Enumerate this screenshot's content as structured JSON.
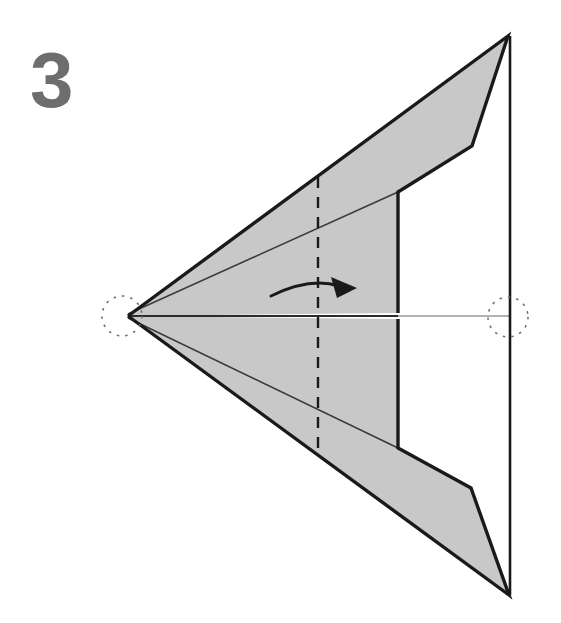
{
  "figure": {
    "kind": "origami-fold-diagram",
    "step_number": "3",
    "step_number_color": "#6e6e6e",
    "background_color": "#ffffff",
    "paper_fill_color": "#c8c8c8",
    "paper_outline_color": "#1a1a1a",
    "crease_line_color": "#1a1a1a",
    "reference_line_color": "#9a9a9a",
    "arrow_color": "#1a1a1a",
    "width": 561,
    "height": 623
  },
  "geometry": {
    "left_apex": {
      "x": 128,
      "y": 316
    },
    "top_right_apex": {
      "x": 508,
      "y": 36
    },
    "bottom_right_apex": {
      "x": 509,
      "y": 595
    },
    "right_edge_x": 510,
    "inner_flap_edge_x": 398,
    "upper_bend_vertex": {
      "x": 472,
      "y": 146
    },
    "upper_notch_corner": {
      "x": 398,
      "y": 192
    },
    "lower_bend_vertex": {
      "x": 471,
      "y": 488
    },
    "lower_notch_corner": {
      "x": 398,
      "y": 448
    },
    "center_line_y": 316,
    "upper_shape": [
      [
        128,
        316
      ],
      [
        508,
        36
      ],
      [
        472,
        146
      ],
      [
        398,
        192
      ],
      [
        398,
        313
      ]
    ],
    "lower_shape": [
      [
        128,
        316
      ],
      [
        398,
        319
      ],
      [
        398,
        448
      ],
      [
        471,
        488
      ],
      [
        509,
        595
      ]
    ]
  },
  "annotations": {
    "valley_crease": {
      "label": "vertical-dashed-crease-line",
      "style": "dashed",
      "x": 318,
      "y_top": 177,
      "y_bottom": 455
    },
    "center_reference_line": {
      "label": "horizontal-center-reference-line",
      "y": 316,
      "x_start": 128,
      "x_end": 511
    },
    "fold_arrow": {
      "label": "fold-right-arrow",
      "direction": "right",
      "start": {
        "x": 271,
        "y": 296
      },
      "control": {
        "x": 310,
        "y": 277
      },
      "tip": {
        "x": 357,
        "y": 288
      }
    },
    "reference_circles": [
      {
        "label": "left-apex-reference-circle",
        "cx": 122,
        "cy": 316,
        "r": 20
      },
      {
        "label": "right-apex-reference-circle",
        "cx": 508,
        "cy": 317,
        "r": 20
      }
    ]
  }
}
